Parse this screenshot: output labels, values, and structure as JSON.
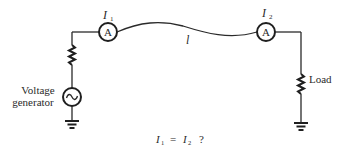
{
  "diagram": {
    "labels": {
      "ammeter_1_current": "I",
      "ammeter_1_sub": "1",
      "ammeter_2_current": "I",
      "ammeter_2_sub": "2",
      "ammeter_symbol": "A",
      "line_length": "l",
      "source_label_line1": "Voltage",
      "source_label_line2": "generator",
      "load_label": "Load",
      "source_symbol": "~"
    },
    "equation": {
      "lhs": "I",
      "lhs_sub": "1",
      "op": "=",
      "rhs": "I",
      "rhs_sub": "2",
      "question": "?"
    },
    "colors": {
      "line": "#2a2a2a",
      "background": "#ffffff"
    }
  }
}
